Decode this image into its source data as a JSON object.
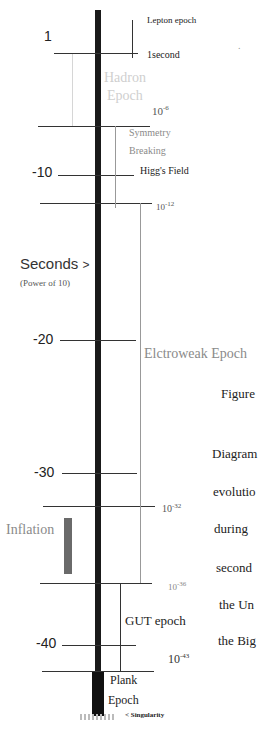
{
  "diagram": {
    "axis_label": "Seconds",
    "axis_label_arrow": ">",
    "axis_sublabel": "(Power of 10)",
    "ticks": [
      {
        "label": "1",
        "y": 53
      },
      {
        "label": "-10",
        "y": 175
      },
      {
        "label": "-20",
        "y": 340
      },
      {
        "label": "-30",
        "y": 473
      },
      {
        "label": "-40",
        "y": 643
      }
    ],
    "time_markers": [
      {
        "label": "1second"
      },
      {
        "base": "10",
        "exp": "-6"
      },
      {
        "base": "10",
        "exp": "-12"
      },
      {
        "base": "10",
        "exp": "-32"
      },
      {
        "base": "10",
        "exp": "-36"
      },
      {
        "base": "10",
        "exp": "-43"
      }
    ],
    "epochs": {
      "lepton": "Lepton epoch",
      "hadron_line1": "Hadron",
      "hadron_line2": "Epoch",
      "symmetry_line1": "Symmetry",
      "symmetry_line2": "Breaking",
      "higgs": "Higg's Field",
      "electroweak": "Elctroweak Epoch",
      "inflation": "Inflation",
      "gut": "GUT epoch",
      "planck_line1": "Plank",
      "planck_line2": "Epoch",
      "singularity": "< Singularity"
    },
    "caption_fragments": [
      "Figure",
      "Diagram",
      "evolutio",
      "during",
      "second",
      "the  Un",
      "the Big"
    ],
    "stray_mark": "."
  }
}
